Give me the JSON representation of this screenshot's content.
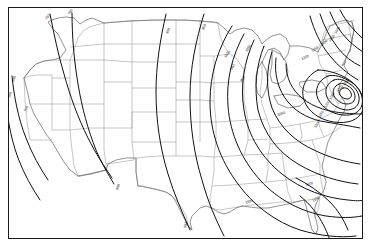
{
  "figure": {
    "kind": "contour-map",
    "region": "Continental United States",
    "frame_color": "#1a1a1a",
    "background_color": "#ffffff",
    "state_line_color": "#8a8a8a",
    "coast_line_color": "#6f6f6f",
    "contour_line_color": "#111111",
    "label_color": "#111111"
  },
  "chart_data": {
    "type": "heatmap",
    "title": "",
    "subtitle": "",
    "xlabel": "",
    "ylabel": "",
    "grid": false,
    "legend_position": "none",
    "projection": "conic",
    "map_extent_note": "Conterminous United States outline with state boundaries",
    "contour_interval": 50,
    "value_min": 600,
    "value_max": 1350,
    "maximum_center": {
      "label": "1350",
      "location_note": "Northeast / southern New England bullseye",
      "x": 345,
      "y": 88
    },
    "contour_levels": [
      600,
      650,
      700,
      750,
      800,
      850,
      900,
      950,
      1000,
      1050,
      1100,
      1150,
      1200,
      1250,
      1300,
      1350
    ],
    "contour_labels": [
      {
        "text": "600",
        "x": 14,
        "y": 82,
        "rotate": -72
      },
      {
        "text": "650",
        "x": 10,
        "y": 98,
        "rotate": -72
      },
      {
        "text": "700",
        "x": 26,
        "y": 112,
        "rotate": -64
      },
      {
        "text": "700",
        "x": 47,
        "y": 20,
        "rotate": -58
      },
      {
        "text": "750",
        "x": 70,
        "y": 15,
        "rotate": -62
      },
      {
        "text": "800",
        "x": 118,
        "y": 190,
        "rotate": -70
      },
      {
        "text": "800",
        "x": 168,
        "y": 34,
        "rotate": -66
      },
      {
        "text": "850",
        "x": 204,
        "y": 30,
        "rotate": -66
      },
      {
        "text": "900",
        "x": 186,
        "y": 228,
        "rotate": -74
      },
      {
        "text": "900",
        "x": 232,
        "y": 70,
        "rotate": -58
      },
      {
        "text": "950",
        "x": 242,
        "y": 82,
        "rotate": -58
      },
      {
        "text": "1000",
        "x": 226,
        "y": 58,
        "rotate": -56
      },
      {
        "text": "1000",
        "x": 246,
        "y": 204,
        "rotate": -20
      },
      {
        "text": "1050",
        "x": 247,
        "y": 52,
        "rotate": -56
      },
      {
        "text": "1050",
        "x": 278,
        "y": 116,
        "rotate": -18
      },
      {
        "text": "1100",
        "x": 306,
        "y": 186,
        "rotate": -16
      },
      {
        "text": "1100",
        "x": 316,
        "y": 128,
        "rotate": -60
      },
      {
        "text": "1150",
        "x": 320,
        "y": 118,
        "rotate": -60
      },
      {
        "text": "1200",
        "x": 326,
        "y": 108,
        "rotate": -60
      },
      {
        "text": "1250",
        "x": 331,
        "y": 100,
        "rotate": -60
      },
      {
        "text": "1200",
        "x": 302,
        "y": 60,
        "rotate": -22
      },
      {
        "text": "1150",
        "x": 312,
        "y": 52,
        "rotate": -30
      },
      {
        "text": "1100",
        "x": 322,
        "y": 46,
        "rotate": -40
      },
      {
        "text": "1050",
        "x": 330,
        "y": 42,
        "rotate": -48
      },
      {
        "text": "1000",
        "x": 336,
        "y": 34,
        "rotate": -58
      },
      {
        "text": "1300",
        "x": 338,
        "y": 92,
        "rotate": -45
      },
      {
        "text": "1350",
        "x": 344,
        "y": 86,
        "rotate": -45
      },
      {
        "text": "1100",
        "x": 313,
        "y": 202,
        "rotate": -28
      }
    ]
  },
  "accessibility": {
    "description": "Black and white contour map of the contiguous United States showing smooth isolines that sweep from the Pacific coast eastward and close into tight concentric rings over the northeastern states."
  }
}
